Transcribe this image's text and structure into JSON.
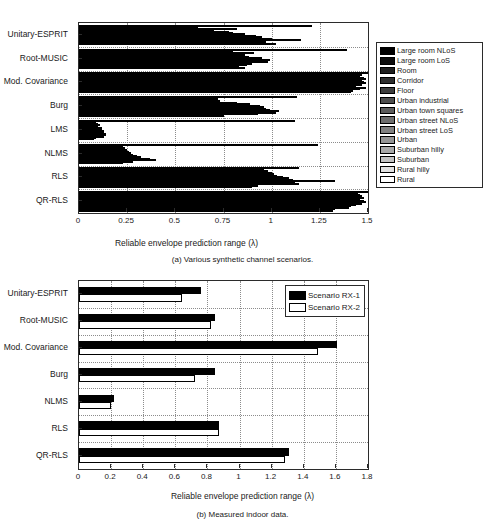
{
  "figure": {
    "axis_title": "Reliable envelope prediction range (λ)"
  },
  "panel_a": {
    "caption": "(a) Various synthetic channel scenarios.",
    "xlabel": "Reliable envelope prediction range (λ)",
    "xticks": [
      "0",
      "0.25",
      "0.5",
      "0.75",
      "1",
      "1.25",
      "1.5"
    ],
    "categories": [
      "Unitary-ESPRIT",
      "Root-MUSIC",
      "Mod. Covariance",
      "Burg",
      "LMS",
      "NLMS",
      "RLS",
      "QR-RLS"
    ],
    "legend": [
      {
        "label": "Large room NLoS",
        "color": "#000000"
      },
      {
        "label": "Large room LoS",
        "color": "#0d0d0d"
      },
      {
        "label": "Room",
        "color": "#1f1f1f"
      },
      {
        "label": "Corridor",
        "color": "#2e2e2e"
      },
      {
        "label": "Floor",
        "color": "#3d3d3d"
      },
      {
        "label": "Urban industrial",
        "color": "#4d4d4d"
      },
      {
        "label": "Urban town squares",
        "color": "#5c5c5c"
      },
      {
        "label": "Urban street NLoS",
        "color": "#6e6e6e"
      },
      {
        "label": "Urban street LoS",
        "color": "#808080"
      },
      {
        "label": "Urban",
        "color": "#949494"
      },
      {
        "label": "Suburban hilly",
        "color": "#a8a8a8"
      },
      {
        "label": "Suburban",
        "color": "#c2c2c2"
      },
      {
        "label": "Rural hilly",
        "color": "#e0e0e0"
      },
      {
        "label": "Rural",
        "color": "#ffffff"
      }
    ]
  },
  "panel_b": {
    "caption": "(b) Measured indoor data.",
    "xlabel": "Reliable envelope prediction range (λ)",
    "xticks": [
      "0",
      "0.2",
      "0.4",
      "0.6",
      "0.8",
      "1",
      "1.2",
      "1.4",
      "1.6",
      "1.8"
    ],
    "categories": [
      "Unitary-ESPRIT",
      "Root-MUSIC",
      "Mod. Covariance",
      "Burg",
      "NLMS",
      "RLS",
      "QR-RLS"
    ],
    "legend": [
      {
        "label": "Scenario RX-1",
        "color": "#000000"
      },
      {
        "label": "Scenario RX-2",
        "color": "#ffffff"
      }
    ]
  },
  "chart_data": [
    {
      "type": "bar",
      "orientation": "horizontal",
      "title": "(a) Various synthetic channel scenarios.",
      "xlabel": "Reliable envelope prediction range (λ)",
      "ylabel": "",
      "xlim": [
        0,
        1.5
      ],
      "xticks": [
        0,
        0.25,
        0.5,
        0.75,
        1,
        1.25,
        1.5
      ],
      "grid": true,
      "legend_position": "right-outside",
      "categories": [
        "Unitary-ESPRIT",
        "Root-MUSIC",
        "Mod. Covariance",
        "Burg",
        "LMS",
        "NLMS",
        "RLS",
        "QR-RLS"
      ],
      "series": [
        {
          "name": "Large room NLoS",
          "color": "#000000",
          "values": [
            1.21,
            1.39,
            1.5,
            1.13,
            1.12,
            1.24,
            1.14,
            1.5
          ]
        },
        {
          "name": "Large room LoS",
          "color": "#0d0d0d",
          "values": [
            0.62,
            0.8,
            1.47,
            0.72,
            0.09,
            0.23,
            0.96,
            1.45
          ]
        },
        {
          "name": "Room",
          "color": "#1f1f1f",
          "values": [
            0.82,
            0.91,
            1.46,
            0.7,
            0.1,
            0.24,
            0.98,
            1.46
          ]
        },
        {
          "name": "Corridor",
          "color": "#2e2e2e",
          "values": [
            0.7,
            0.83,
            1.48,
            0.73,
            0.11,
            0.24,
            1.0,
            1.47
          ]
        },
        {
          "name": "Floor",
          "color": "#3d3d3d",
          "values": [
            0.78,
            0.86,
            1.49,
            0.82,
            0.1,
            0.25,
            1.01,
            1.48
          ]
        },
        {
          "name": "Urban industrial",
          "color": "#4d4d4d",
          "values": [
            0.8,
            0.88,
            1.47,
            0.89,
            0.12,
            0.26,
            1.03,
            1.46
          ]
        },
        {
          "name": "Urban town squares",
          "color": "#5c5c5c",
          "values": [
            0.86,
            0.95,
            1.48,
            0.94,
            0.12,
            0.27,
            1.06,
            1.48
          ]
        },
        {
          "name": "Urban street NLoS",
          "color": "#6e6e6e",
          "values": [
            0.92,
            0.99,
            1.49,
            0.96,
            0.13,
            0.28,
            1.09,
            1.49
          ]
        },
        {
          "name": "Urban street LoS",
          "color": "#808080",
          "values": [
            0.95,
            0.94,
            1.47,
            0.97,
            0.13,
            0.3,
            1.11,
            1.47
          ]
        },
        {
          "name": "Urban",
          "color": "#949494",
          "values": [
            1.0,
            0.98,
            1.44,
            0.99,
            0.14,
            0.32,
            1.33,
            1.44
          ]
        },
        {
          "name": "Suburban hilly",
          "color": "#a8a8a8",
          "values": [
            1.15,
            0.9,
            1.49,
            1.04,
            0.14,
            0.37,
            1.12,
            1.41
          ]
        },
        {
          "name": "Suburban",
          "color": "#c2c2c2",
          "values": [
            0.97,
            0.87,
            1.46,
            1.02,
            0.13,
            0.4,
            1.14,
            1.4
          ]
        },
        {
          "name": "Rural hilly",
          "color": "#e0e0e0",
          "values": [
            0.92,
            0.83,
            1.42,
            0.93,
            0.09,
            0.28,
            0.93,
            1.33
          ]
        },
        {
          "name": "Rural",
          "color": "#ffffff",
          "values": [
            1.02,
            0.86,
            1.41,
            0.75,
            0.08,
            0.23,
            0.9,
            1.32
          ]
        }
      ]
    },
    {
      "type": "bar",
      "orientation": "horizontal",
      "title": "(b) Measured indoor data.",
      "xlabel": "Reliable envelope prediction range (λ)",
      "ylabel": "",
      "xlim": [
        0,
        1.8
      ],
      "xticks": [
        0,
        0.2,
        0.4,
        0.6,
        0.8,
        1,
        1.2,
        1.4,
        1.6,
        1.8
      ],
      "grid": true,
      "legend_position": "top-right-inside",
      "categories": [
        "Unitary-ESPRIT",
        "Root-MUSIC",
        "Mod. Covariance",
        "Burg",
        "NLMS",
        "RLS",
        "QR-RLS"
      ],
      "series": [
        {
          "name": "Scenario RX-1",
          "color": "#000000",
          "values": [
            0.76,
            0.85,
            1.61,
            0.85,
            0.22,
            0.87,
            1.31
          ]
        },
        {
          "name": "Scenario RX-2",
          "color": "#ffffff",
          "values": [
            0.64,
            0.82,
            1.49,
            0.72,
            0.2,
            0.87,
            1.28
          ]
        }
      ]
    }
  ]
}
